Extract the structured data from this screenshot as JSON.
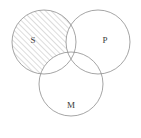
{
  "figure": {
    "background_color": "#ffffff",
    "stroke_color": "#8e8e8e",
    "hatch_color": "#9a9a9a",
    "label_color": "#3a3a3a"
  },
  "circles": [
    {
      "id": "S",
      "label": "S",
      "cx": 44,
      "cy": 42,
      "r": 32,
      "label_x": 33,
      "label_y": 41
    },
    {
      "id": "P",
      "label": "P",
      "cx": 98,
      "cy": 42,
      "r": 32,
      "label_x": 105,
      "label_y": 41
    },
    {
      "id": "M",
      "label": "M",
      "cx": 71,
      "cy": 84,
      "r": 32,
      "label_x": 71,
      "label_y": 106
    }
  ],
  "shading": {
    "region": "S-only",
    "description": "Region inside circle S but outside circles P and M is hatched",
    "pattern": "diagonal-lines",
    "angle_degrees": 45,
    "direction": "lower-left-to-upper-right",
    "spacing_px": 4,
    "color": "#9a9a9a"
  }
}
